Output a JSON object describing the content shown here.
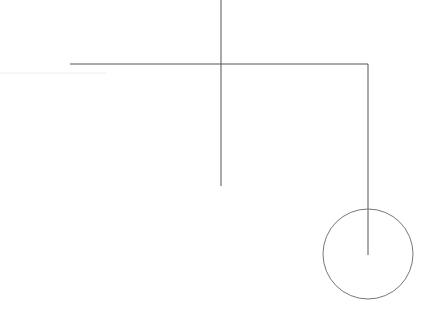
{
  "canvas": {
    "width": 429,
    "height": 312,
    "background": "#ffffff"
  },
  "colors": {
    "stroke": "#555555",
    "faint": "#eeeeee"
  },
  "shapes": {
    "faint_line": {
      "x1": 0,
      "y1": 73,
      "x2": 106,
      "y2": 73
    },
    "horizontal_line": {
      "x1": 70,
      "y1": 64,
      "x2": 368,
      "y2": 64
    },
    "vertical_center_line": {
      "x1": 221,
      "y1": 0,
      "x2": 221,
      "y2": 186
    },
    "vertical_right_line": {
      "x1": 368,
      "y1": 64,
      "x2": 368,
      "y2": 255
    },
    "circle": {
      "cx": 368,
      "cy": 254,
      "r": 45
    }
  }
}
